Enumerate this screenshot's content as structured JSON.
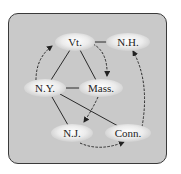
{
  "diagram": {
    "type": "graph",
    "nodes": [
      {
        "id": "vt",
        "label": "Vt.",
        "x": 75,
        "y": 42
      },
      {
        "id": "nh",
        "label": "N.H.",
        "x": 128,
        "y": 42
      },
      {
        "id": "ny",
        "label": "N.Y.",
        "x": 45,
        "y": 88
      },
      {
        "id": "mass",
        "label": "Mass.",
        "x": 100,
        "y": 88
      },
      {
        "id": "nj",
        "label": "N.J.",
        "x": 72,
        "y": 133
      },
      {
        "id": "conn",
        "label": "Conn.",
        "x": 128,
        "y": 133
      }
    ],
    "solid_edges": [
      [
        "vt",
        "ny"
      ],
      [
        "vt",
        "mass"
      ],
      [
        "vt",
        "nh"
      ],
      [
        "ny",
        "mass"
      ],
      [
        "ny",
        "nj"
      ],
      [
        "ny",
        "conn"
      ]
    ],
    "dashed_arrows": [
      [
        "ny",
        "vt"
      ],
      [
        "vt",
        "mass"
      ],
      [
        "mass",
        "nj"
      ],
      [
        "nj",
        "conn"
      ],
      [
        "conn",
        "nh"
      ]
    ]
  }
}
